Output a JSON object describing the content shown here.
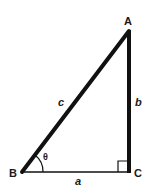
{
  "diagram": {
    "type": "right-triangle",
    "vertices": {
      "A": {
        "label": "A"
      },
      "B": {
        "label": "B"
      },
      "C": {
        "label": "C"
      }
    },
    "sides": {
      "a": {
        "label": "a",
        "between": [
          "B",
          "C"
        ]
      },
      "b": {
        "label": "b",
        "between": [
          "C",
          "A"
        ]
      },
      "c": {
        "label": "c",
        "between": [
          "B",
          "A"
        ]
      }
    },
    "angle": {
      "label": "θ",
      "at": "B"
    },
    "right_angle_at": "C",
    "colors": {
      "stroke": "#111111",
      "background": "#ffffff"
    }
  }
}
